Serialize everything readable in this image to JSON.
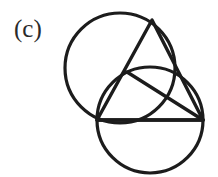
{
  "figure": {
    "panel_label": "(c)",
    "caption_position": "top-left",
    "background_color": "#ffffff",
    "stroke_color": "#1c1c1c",
    "label_color": "#2a2a2a",
    "canvas": {
      "width": 218,
      "height": 177
    }
  },
  "chart_data": {
    "type": "diagram",
    "title": "(c)",
    "xlabel": "",
    "ylabel": "",
    "grid": false,
    "legend": "none",
    "stroke_width": 3,
    "points": [
      {
        "name": "apex",
        "x": 152,
        "y": 20
      },
      {
        "name": "left-vertex",
        "x": 97,
        "y": 120
      },
      {
        "name": "right-vertex",
        "x": 203,
        "y": 120
      },
      {
        "name": "inner-node",
        "x": 127,
        "y": 72
      }
    ],
    "shapes": [
      {
        "name": "upper-circle",
        "kind": "circle",
        "cx": 120,
        "cy": 68,
        "r": 55
      },
      {
        "name": "lower-circle",
        "kind": "circle",
        "cx": 150,
        "cy": 120,
        "r": 53
      },
      {
        "name": "triangle",
        "kind": "polygon",
        "vertices": "152,20 97,120 203,120"
      },
      {
        "name": "inner-chord",
        "kind": "line",
        "x1": 127,
        "y1": 72,
        "x2": 203,
        "y2": 120
      },
      {
        "name": "upper-left-segment",
        "kind": "line",
        "x1": 152,
        "y1": 20,
        "x2": 127,
        "y2": 72
      }
    ]
  }
}
